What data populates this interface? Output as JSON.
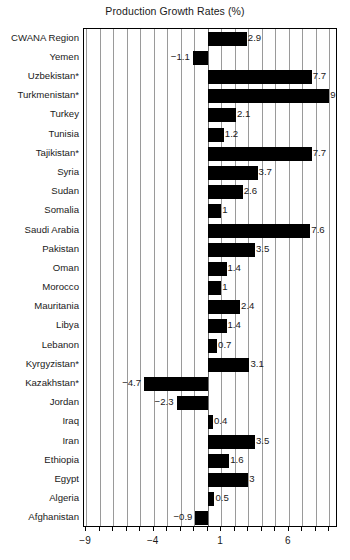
{
  "chart_data": {
    "type": "bar",
    "orientation": "horizontal",
    "title": "Production Growth Rates (%)",
    "xlabel": "",
    "ylabel": "",
    "xlim": [
      -9.15,
      9.65
    ],
    "xticks": [
      -9,
      -4,
      1,
      6
    ],
    "xtick_labels": [
      "−9",
      "−4",
      "1",
      "6"
    ],
    "grid": true,
    "grid_axis": "x",
    "grid_step": 1,
    "legend": "none",
    "bar_color": "#000000",
    "categories": [
      "CWANA Region",
      "Yemen",
      "Uzbekistan*",
      "Turkmenistan*",
      "Turkey",
      "Tunisia",
      "Tajikistan*",
      "Syria",
      "Sudan",
      "Somalia",
      "Saudi Arabia",
      "Pakistan",
      "Oman",
      "Morocco",
      "Mauritania",
      "Libya",
      "Lebanon",
      "Kyrgyzistan*",
      "Kazakhstan*",
      "Jordan",
      "Iraq",
      "Iran",
      "Ethiopia",
      "Egypt",
      "Algeria",
      "Afghanistan"
    ],
    "values": [
      2.9,
      -1.1,
      7.7,
      9,
      2.1,
      1.2,
      7.7,
      3.7,
      2.6,
      1,
      7.6,
      3.5,
      1.4,
      1,
      2.4,
      1.4,
      0.7,
      3.1,
      -4.7,
      -2.3,
      0.4,
      3.5,
      1.6,
      3,
      0.5,
      -0.9
    ],
    "value_labels": [
      "2.9",
      "−1.1",
      "7.7",
      "9",
      "2.1",
      "1.2",
      "7.7",
      "3.7",
      "2.6",
      "1",
      "7.6",
      "3.5",
      "1.4",
      "1",
      "2.4",
      "1.4",
      "0.7",
      "3.1",
      "−4.7",
      "−2.3",
      "0.4",
      "3.5",
      "1.6",
      "3",
      "0.5",
      "−0.9"
    ]
  }
}
